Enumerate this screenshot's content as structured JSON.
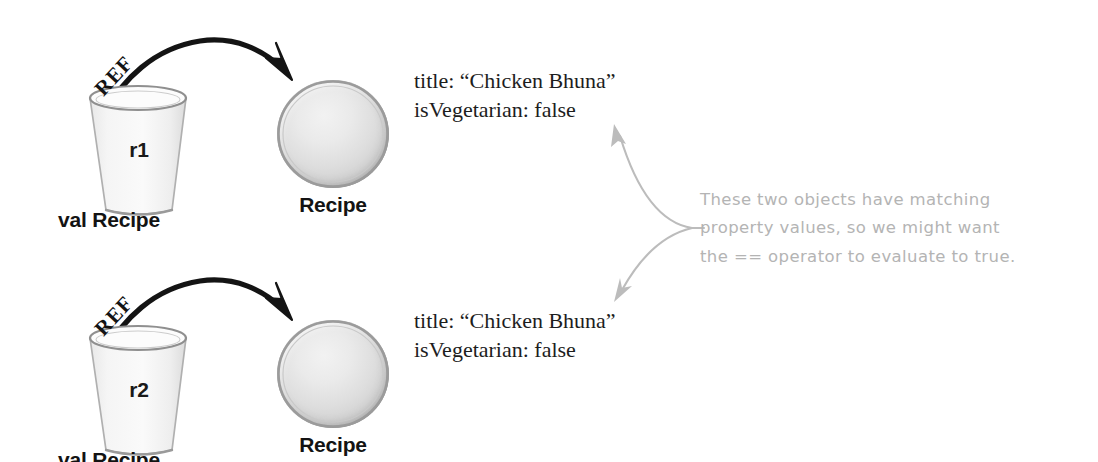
{
  "canvas": {
    "width": 1098,
    "height": 462,
    "background": "#ffffff"
  },
  "style": {
    "ink_black": "#131313",
    "pencil_gray": "#b4b4b4",
    "ball_fill": "#e2e2e2",
    "ball_outline": "#8c8c8c"
  },
  "rows": [
    {
      "ref_name": "r1",
      "ref_arrow_label": "REF",
      "declaration_label": "val Recipe",
      "object_label": "Recipe",
      "properties": [
        "title: “Chicken Bhuna”",
        "isVegetarian: false"
      ]
    },
    {
      "ref_name": "r2",
      "ref_arrow_label": "REF",
      "declaration_label": "val Recipe",
      "object_label": "Recipe",
      "properties": [
        "title: “Chicken Bhuna”",
        "isVegetarian: false"
      ]
    }
  ],
  "annotation": {
    "lines": [
      "These two objects have matching",
      "property values, so we might want",
      "the == operator to evaluate to true."
    ],
    "color": "#b4b4b4"
  }
}
